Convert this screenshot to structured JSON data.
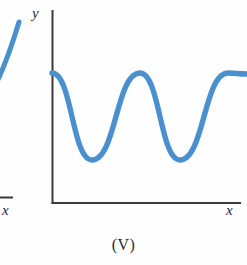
{
  "figure": {
    "caption": "(V)",
    "background_color": "#fefefe",
    "width": 247,
    "height": 265
  },
  "axes": {
    "y_label": "y",
    "x_label": "x",
    "axis_color": "#3a3a3a",
    "origin_x": 52,
    "origin_y": 203,
    "x_axis_end": 241,
    "y_axis_top": 10
  },
  "neighbor_figure": {
    "x_label": "x",
    "curve_color": "#4a90cf",
    "axis_color": "#3a3a3a",
    "note": "partial adjacent figure cropped at left edge"
  },
  "chart_data": {
    "type": "line",
    "title": "(V)",
    "xlabel": "x",
    "ylabel": "y",
    "grid": false,
    "legend": null,
    "series": [
      {
        "name": "periodic cosine-like curve",
        "color": "#4a90cf",
        "line_width": 5,
        "description": "Smooth periodic wave beginning at a maximum on the y-axis, with two full troughs and an interior maximum, ending rising to a maximum at the right edge.",
        "period_px": 88,
        "max_y_px": 73,
        "min_y_px": 160,
        "points": [
          {
            "x": 52,
            "y": 73,
            "kind": "maximum"
          },
          {
            "x": 92,
            "y": 160,
            "kind": "minimum"
          },
          {
            "x": 140,
            "y": 73,
            "kind": "maximum"
          },
          {
            "x": 180,
            "y": 160,
            "kind": "minimum"
          },
          {
            "x": 228,
            "y": 73,
            "kind": "maximum"
          },
          {
            "x": 247,
            "y": 74,
            "kind": "edge"
          }
        ]
      }
    ],
    "xlim": [
      52,
      247
    ],
    "ylim": [
      203,
      60
    ]
  }
}
